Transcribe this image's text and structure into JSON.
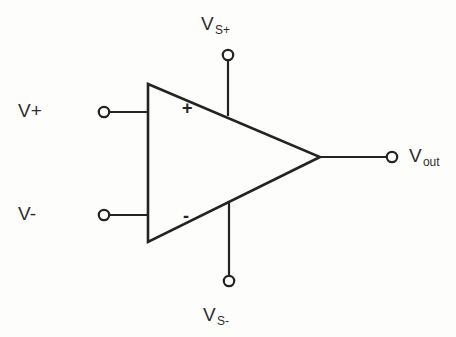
{
  "diagram": {
    "type": "circuit-schematic",
    "background_color": "#fdfdfb",
    "stroke_color": "#232323",
    "text_color": "#2e2e2e",
    "body": {
      "shape": "triangle",
      "points": "148,84 148,242 320,157"
    },
    "terminals": [
      {
        "id": "v-plus",
        "label_base": "V+",
        "label_sub": "",
        "role": "non-inverting-input",
        "polarity_sign": "+",
        "side": "left",
        "node_x": 104,
        "node_y": 112
      },
      {
        "id": "v-minus",
        "label_base": "V-",
        "label_sub": "",
        "role": "inverting-input",
        "polarity_sign": "-",
        "side": "left",
        "node_x": 104,
        "node_y": 215
      },
      {
        "id": "vs-plus",
        "label_base": "V",
        "label_sub": "S+",
        "role": "positive-supply",
        "polarity_sign": "",
        "side": "top",
        "node_x": 228,
        "node_y": 55
      },
      {
        "id": "vs-minus",
        "label_base": "V",
        "label_sub": "S-",
        "role": "negative-supply",
        "polarity_sign": "",
        "side": "bottom",
        "node_x": 229,
        "node_y": 281
      },
      {
        "id": "v-out",
        "label_base": "V",
        "label_sub": "out",
        "role": "output",
        "polarity_sign": "",
        "side": "right",
        "node_x": 392,
        "node_y": 157
      }
    ]
  }
}
